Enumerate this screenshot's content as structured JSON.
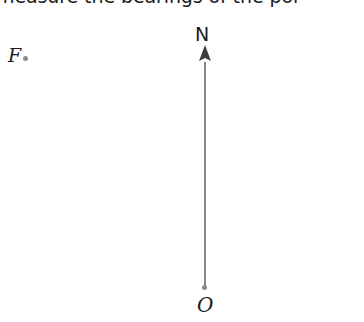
{
  "page": {
    "width": 364,
    "height": 322,
    "background_color": "#ffffff"
  },
  "question": {
    "text": "measure the bearings of the poi",
    "note_clipped": "top of text is cut off by the screenshot edge",
    "color": "#1a1a1a"
  },
  "diagram": {
    "type": "bearings-diagram",
    "line_color": "#7a7a7a",
    "marker_color": "#8a8a8a",
    "label_color": "#1a1a1a",
    "points": [
      {
        "id": "F",
        "label": "F",
        "style": "italic",
        "marker_x": 25,
        "marker_y": 58,
        "label_x": 10,
        "label_y": 48
      },
      {
        "id": "O",
        "label": "O",
        "style": "italic",
        "marker_x": 205,
        "marker_y": 288,
        "label_x": 199,
        "label_y": 296
      }
    ],
    "north_arrow": {
      "label": "N",
      "label_style": "roman",
      "label_x": 204,
      "label_y": 34,
      "tail_x": 205,
      "tail_y": 288,
      "head_x": 205,
      "head_y": 46,
      "shaft_width": 1.6,
      "head_width": 12,
      "head_length": 15
    }
  }
}
